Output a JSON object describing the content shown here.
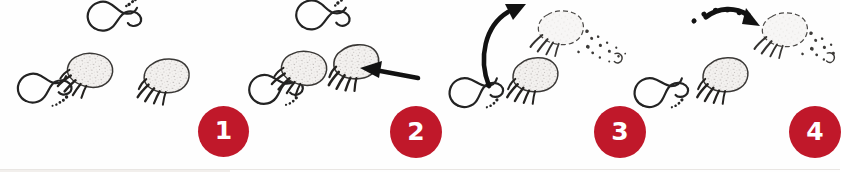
{
  "figure": {
    "type": "illustration",
    "background_color": "#fefefe",
    "ink_color": "#2b2b2b",
    "marker_color": "#c0182a",
    "marker_text_color": "#ffffff"
  },
  "panels": [
    {
      "number": "1",
      "marker_label": "1",
      "arrow": "none",
      "tracks": [
        {
          "kind": "human-footprint",
          "state": "outline"
        },
        {
          "kind": "bear-paw-print",
          "state": "shaded"
        },
        {
          "kind": "bear-paw-print",
          "state": "shaded"
        },
        {
          "kind": "human-footprint",
          "state": "outline"
        }
      ]
    },
    {
      "number": "2",
      "marker_label": "2",
      "arrow": "straight-left-arrow",
      "tracks": [
        {
          "kind": "human-footprint",
          "state": "outline"
        },
        {
          "kind": "bear-paw-print",
          "state": "shaded"
        },
        {
          "kind": "bear-paw-print",
          "state": "shaded"
        },
        {
          "kind": "human-footprint",
          "state": "outline"
        }
      ]
    },
    {
      "number": "3",
      "marker_label": "3",
      "arrow": "curved-up-right-arrow",
      "tracks": [
        {
          "kind": "bear-paw-print",
          "state": "dissolving"
        },
        {
          "kind": "bear-paw-print",
          "state": "shaded"
        },
        {
          "kind": "human-footprint",
          "state": "outline"
        }
      ]
    },
    {
      "number": "4",
      "marker_label": "4",
      "arrow": "dashed-right-arrow",
      "tracks": [
        {
          "kind": "bear-paw-print",
          "state": "dissolving"
        },
        {
          "kind": "bear-paw-print",
          "state": "shaded"
        },
        {
          "kind": "human-footprint",
          "state": "outline"
        }
      ]
    }
  ],
  "markers": [
    {
      "label": "1",
      "x": 198,
      "y": 106,
      "size": 51
    },
    {
      "label": "2",
      "x": 390,
      "y": 106,
      "size": 52
    },
    {
      "label": "3",
      "x": 594,
      "y": 106,
      "size": 52
    },
    {
      "label": "4",
      "x": 789,
      "y": 106,
      "size": 52
    }
  ],
  "footer": {
    "rule_color": "#e9e6e3"
  }
}
